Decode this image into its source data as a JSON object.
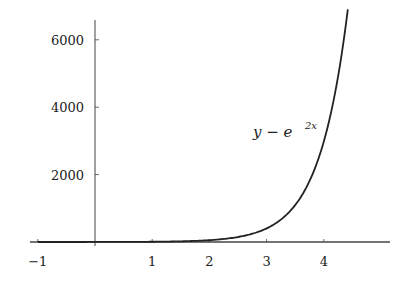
{
  "chart_data": {
    "type": "line",
    "title": "",
    "xlabel": "",
    "ylabel": "",
    "function": "y = e^(2x)",
    "annotation": {
      "base": "y = e",
      "exponent": "2x",
      "x": 3.0,
      "y": 3300
    },
    "xlim": [
      -1.1,
      5.0
    ],
    "ylim": [
      0,
      7000
    ],
    "x_ticks": [
      -1,
      1,
      2,
      3,
      4
    ],
    "x_tick_labels": [
      "−1",
      "1",
      "2",
      "3",
      "4"
    ],
    "y_ticks": [
      2000,
      4000,
      6000
    ],
    "y_tick_labels": [
      "2000",
      "4000",
      "6000"
    ],
    "grid": false,
    "legend": null,
    "series": [
      {
        "name": "y = e^{2x}",
        "x": [
          -1,
          -0.5,
          0,
          0.5,
          1,
          1.5,
          2,
          2.5,
          3,
          3.25,
          3.5,
          3.75,
          4,
          4.1,
          4.2,
          4.3,
          4.42
        ],
        "values": [
          0.14,
          0.37,
          1,
          2.72,
          7.39,
          20.1,
          54.6,
          148.4,
          403.4,
          665.1,
          1096.6,
          1808.0,
          2981.0,
          3641.0,
          4447.1,
          5431.7,
          6888.0
        ]
      }
    ],
    "color": "#222222"
  }
}
